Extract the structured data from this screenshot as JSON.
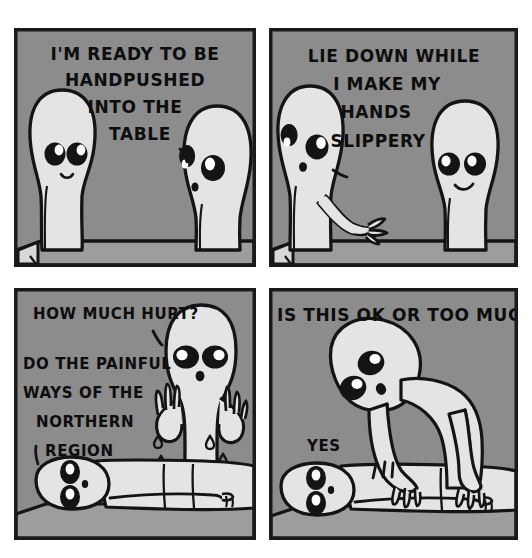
{
  "comic": {
    "title": "Handpushed Into The Table",
    "format": "four-panel grid comic",
    "palette": {
      "page_background": "#ffffff",
      "panel_background": "#8c8c8c",
      "panel_border": "#1a1a1a",
      "character_fill": "#e4e4e4",
      "character_shadow": "#c4c4c4",
      "ink": "#141414",
      "eye_white": "#ffffff",
      "table_top": "#9d9d9d",
      "table_side": "#d8d8d8"
    },
    "panels": [
      {
        "id": "panel-1",
        "position": "top-left",
        "setting": "two figures standing on either side of a massage table",
        "lines": [
          {
            "speaker": "left-figure",
            "text": "I'M READY TO BE"
          },
          {
            "speaker": "left-figure",
            "text": "HANDPUSHED"
          },
          {
            "speaker": "left-figure",
            "text": "INTO THE"
          },
          {
            "speaker": "left-figure",
            "text": "TABLE"
          }
        ],
        "tail_owner": "right-figure",
        "characters": [
          {
            "name": "client-figure",
            "pose": "standing-facing-right",
            "expression": "neutral-smile"
          },
          {
            "name": "masseur-figure",
            "pose": "standing-profile-left",
            "expression": "listening"
          }
        ]
      },
      {
        "id": "panel-2",
        "position": "top-right",
        "setting": "masseur gesturing toward the table",
        "lines": [
          {
            "speaker": "left-figure",
            "text": "LIE DOWN WHILE"
          },
          {
            "speaker": "left-figure",
            "text": "I MAKE MY"
          },
          {
            "speaker": "left-figure",
            "text": "HANDS"
          },
          {
            "speaker": "left-figure",
            "text": "SLIPPERY"
          }
        ],
        "tail_owner": "left-figure",
        "characters": [
          {
            "name": "masseur-figure",
            "pose": "standing-arm-extended",
            "expression": "neutral"
          },
          {
            "name": "client-figure",
            "pose": "standing-facing-left",
            "expression": "smiling"
          }
        ]
      },
      {
        "id": "panel-3",
        "position": "bottom-left",
        "setting": "client lying face down on the table, masseur with raised dripping hands",
        "lines": [
          {
            "speaker": "masseur-figure",
            "text": "HOW MUCH HURT?"
          },
          {
            "speaker": "client-figure",
            "text": "DO THE PAINFUL"
          },
          {
            "speaker": "client-figure",
            "text": "WAYS OF THE"
          },
          {
            "speaker": "client-figure",
            "text": "NORTHERN"
          },
          {
            "speaker": "client-figure",
            "text": "REGION"
          }
        ],
        "tail_owner": "masseur-figure",
        "characters": [
          {
            "name": "masseur-figure",
            "pose": "standing-hands-up-dripping",
            "expression": "wide-eyed"
          },
          {
            "name": "client-figure",
            "pose": "lying-prone",
            "expression": "wide-eyed"
          }
        ],
        "effects": [
          {
            "name": "sweat-drop",
            "count": 4
          }
        ]
      },
      {
        "id": "panel-4",
        "position": "bottom-right",
        "setting": "masseur leaning over and pressing on the client's back",
        "lines": [
          {
            "speaker": "masseur-figure",
            "text": "IS THIS OK OR TOO MUCH?"
          },
          {
            "speaker": "client-figure",
            "text": "YES"
          }
        ],
        "characters": [
          {
            "name": "masseur-figure",
            "pose": "leaning-forward-both-hands-pressing",
            "expression": "concerned"
          },
          {
            "name": "client-figure",
            "pose": "lying-prone",
            "expression": "wide-eyed"
          }
        ],
        "effects": [
          {
            "name": "impact-lines",
            "count": 3
          }
        ]
      }
    ]
  }
}
